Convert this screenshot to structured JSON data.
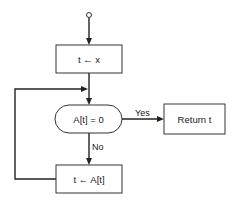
{
  "diagram": {
    "type": "flowchart",
    "start": {
      "shape": "circle"
    },
    "nodes": [
      {
        "id": "init",
        "shape": "rectangle",
        "label": "t ← x"
      },
      {
        "id": "test",
        "shape": "rounded-terminal",
        "label": "A[t] = 0"
      },
      {
        "id": "return",
        "shape": "rectangle",
        "label": "Return t"
      },
      {
        "id": "step",
        "shape": "rectangle",
        "label": "t ← A[t]"
      }
    ],
    "edges": [
      {
        "from": "start",
        "to": "init",
        "label": ""
      },
      {
        "from": "init",
        "to": "test",
        "label": ""
      },
      {
        "from": "test",
        "to": "return",
        "label": "Yes"
      },
      {
        "from": "test",
        "to": "step",
        "label": "No"
      },
      {
        "from": "step",
        "to": "test",
        "label": ""
      }
    ],
    "labels": {
      "init": "t ← x",
      "test": "A[t] = 0",
      "return": "Return t",
      "step": "t ← A[t]",
      "yes": "Yes",
      "no": "No"
    }
  }
}
